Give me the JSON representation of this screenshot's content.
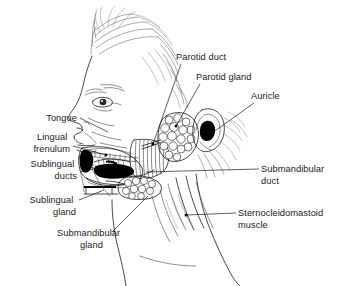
{
  "figure": {
    "style": "black and white line drawing",
    "background_color": "#ffffff",
    "ink_color": "#1a1a1a",
    "width": 342,
    "height": 286
  },
  "labels": [
    {
      "id": "tongue",
      "text": "Tongue",
      "align": "right",
      "lines": [
        "Tongue"
      ],
      "text_x": 77,
      "text_y": 121,
      "leader": "M 80,118 L 108,132",
      "anchor": {
        "x": 109,
        "y": 133
      },
      "has_dot": false
    },
    {
      "id": "lingual-frenulum",
      "text": "Lingual frenulum",
      "align": "right",
      "lines": [
        "Lingual",
        "frenulum"
      ],
      "text_x": 70,
      "text_y": 140,
      "leader": "M 73,146 L 106,155",
      "anchor": {
        "x": 107,
        "y": 155
      },
      "has_dot": true
    },
    {
      "id": "sublingual-ducts",
      "text": "Sublingual ducts",
      "align": "right",
      "lines": [
        "Sublingual",
        "ducts"
      ],
      "text_x": 77,
      "text_y": 167,
      "leader": "M 80,172 L 116,164",
      "anchor": {
        "x": 117,
        "y": 164
      },
      "has_dot": true
    },
    {
      "id": "sublingual-gland",
      "text": "Sublingual gland",
      "align": "right",
      "lines": [
        "Sublingual",
        "gland"
      ],
      "text_x": 76,
      "text_y": 203,
      "leader": "M 79,200 L 104,190",
      "anchor": {
        "x": 105,
        "y": 190
      },
      "has_dot": false
    },
    {
      "id": "submandibular-gland",
      "text": "Submandibular gland",
      "align": "left",
      "lines": [
        "Submandibular",
        "gland"
      ],
      "text_x": 57,
      "text_y": 236,
      "leader": "M 112,232 L 148,196",
      "anchor": {
        "x": 149,
        "y": 195
      },
      "has_dot": false
    },
    {
      "id": "parotid-duct",
      "text": "Parotid duct",
      "align": "left",
      "lines": [
        "Parotid duct"
      ],
      "text_x": 176,
      "text_y": 60,
      "leader": "M 181,64 L 153,144",
      "anchor": {
        "x": 152,
        "y": 145
      },
      "has_dot": true
    },
    {
      "id": "parotid-gland",
      "text": "Parotid gland",
      "align": "left",
      "lines": [
        "Parotid gland"
      ],
      "text_x": 196,
      "text_y": 80,
      "leader": "M 200,84 L 176,126",
      "anchor": {
        "x": 175,
        "y": 127
      },
      "has_dot": true
    },
    {
      "id": "auricle",
      "text": "Auricle",
      "align": "left",
      "lines": [
        "Auricle"
      ],
      "text_x": 251,
      "text_y": 99,
      "leader": "M 254,103 L 212,133",
      "anchor": {
        "x": 211,
        "y": 134
      },
      "has_dot": false
    },
    {
      "id": "submandibular-duct",
      "text": "Submandibular duct",
      "align": "left",
      "lines": [
        "Submandibular",
        "duct"
      ],
      "text_x": 261,
      "text_y": 172,
      "leader": "M 259,169 L 146,172",
      "anchor": {
        "x": 145,
        "y": 172
      },
      "has_dot": false
    },
    {
      "id": "sternocleidomastoid-muscle",
      "text": "Sternocleidomastoid muscle",
      "align": "left",
      "lines": [
        "Sternocleidomastoid",
        "muscle"
      ],
      "text_x": 238,
      "text_y": 216,
      "leader": "M 236,213 L 186,215",
      "anchor": {
        "x": 185,
        "y": 215
      },
      "has_dot": true
    }
  ],
  "structures": [
    {
      "id": "head-profile",
      "name": "head-profile-outline"
    },
    {
      "id": "hair",
      "name": "hair-strands"
    },
    {
      "id": "eye",
      "name": "eye"
    },
    {
      "id": "nose",
      "name": "nose"
    },
    {
      "id": "lips",
      "name": "lips"
    },
    {
      "id": "oral-cavity",
      "name": "oral-cavity-with-tongue"
    },
    {
      "id": "masseter",
      "name": "masseter-muscle-striations"
    },
    {
      "id": "parotid",
      "name": "parotid-gland-lobules"
    },
    {
      "id": "auricle",
      "name": "auricle-ear"
    },
    {
      "id": "submandibular",
      "name": "submandibular-gland-lobules"
    },
    {
      "id": "neck",
      "name": "neck-and-sternocleidomastoid"
    },
    {
      "id": "mandible",
      "name": "mandible-jaw-outline"
    }
  ]
}
